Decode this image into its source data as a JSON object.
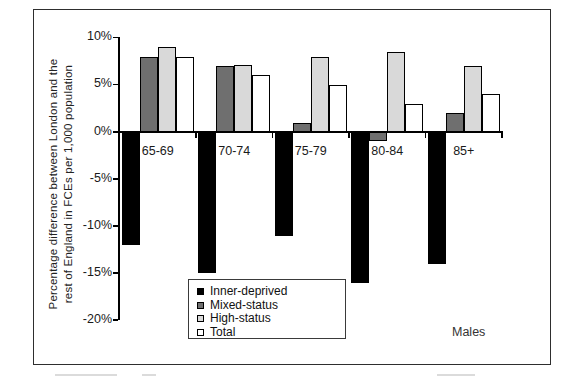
{
  "figure": {
    "y_axis_title_line1": "Percentage difference between London and the",
    "y_axis_title_line2": "rest of England in FCEs per 1,000 population"
  },
  "chart_data": {
    "type": "bar",
    "title": "",
    "xlabel": "",
    "ylabel": "Percentage difference between London and the rest of England in FCEs per 1,000 population",
    "categories": [
      "65-69",
      "70-74",
      "75-79",
      "80-84",
      "85+"
    ],
    "series": [
      {
        "name": "Inner-deprived",
        "color": "#000000",
        "values": [
          -12,
          -15,
          -11,
          -16,
          -14
        ]
      },
      {
        "name": "Mixed-status",
        "color": "#6f6f6f",
        "values": [
          8,
          7,
          1,
          -1,
          2
        ]
      },
      {
        "name": "High-status",
        "color": "#d9d9d9",
        "values": [
          9,
          7.1,
          8,
          8.5,
          7
        ]
      },
      {
        "name": "Total",
        "color": "#ffffff",
        "values": [
          8,
          6,
          5,
          3,
          4
        ]
      }
    ],
    "ylim": [
      -20,
      10
    ],
    "yticks": [
      {
        "value": 10,
        "label": "10%"
      },
      {
        "value": 5,
        "label": "5%"
      },
      {
        "value": 0,
        "label": "0%"
      },
      {
        "value": -5,
        "label": "-5%"
      },
      {
        "value": -10,
        "label": "-10%"
      },
      {
        "value": -15,
        "label": "-15%"
      },
      {
        "value": -20,
        "label": "-20%"
      }
    ],
    "grid": false,
    "legend_position": "inside-bottom-center",
    "annotations": [
      "Males"
    ]
  }
}
